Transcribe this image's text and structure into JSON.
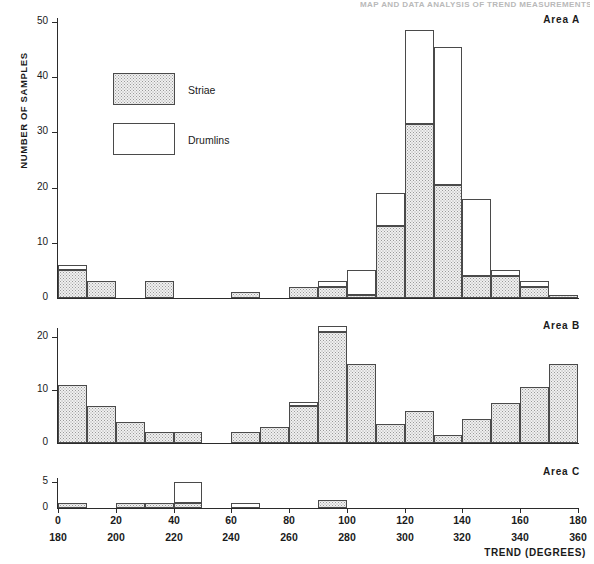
{
  "figure": {
    "cropped_header_text": "MAP AND DATA ANALYSIS OF TREND MEASUREMENTS",
    "y_axis_label": "NUMBER OF SAMPLES",
    "x_axis_label": "TREND (DEGREES)"
  },
  "legend": {
    "items": [
      {
        "label": "Striae",
        "pattern": "stippled"
      },
      {
        "label": "Drumlins",
        "pattern": "open"
      }
    ]
  },
  "panels": [
    {
      "tag": "Area A"
    },
    {
      "tag": "Area B"
    },
    {
      "tag": "Area C"
    }
  ],
  "chart_data": {
    "type": "bar",
    "subtype": "stacked-histogram",
    "title": "",
    "xlabel": "TREND (DEGREES)",
    "ylabel": "NUMBER OF SAMPLES",
    "bin_width": 10,
    "x": [
      0,
      10,
      20,
      30,
      40,
      50,
      60,
      70,
      80,
      90,
      100,
      110,
      120,
      130,
      140,
      150,
      160,
      170
    ],
    "bin_starts_primary": [
      0,
      10,
      20,
      30,
      40,
      50,
      60,
      70,
      80,
      90,
      100,
      110,
      120,
      130,
      140,
      150,
      160,
      170
    ],
    "bin_starts_secondary": [
      180,
      190,
      200,
      210,
      220,
      230,
      240,
      250,
      260,
      270,
      280,
      290,
      300,
      310,
      320,
      330,
      340,
      350
    ],
    "x_ticks_primary": [
      0,
      20,
      40,
      60,
      80,
      100,
      120,
      140,
      160,
      180
    ],
    "x_ticks_secondary": [
      180,
      200,
      220,
      240,
      260,
      280,
      300,
      320,
      340,
      360
    ],
    "xlim": [
      0,
      180
    ],
    "grid": false,
    "legend_position": "upper-left",
    "panels": [
      {
        "name": "Area A",
        "ylim": [
          0,
          52
        ],
        "y_ticks": [
          0,
          10,
          20,
          30,
          40,
          50
        ],
        "series": [
          {
            "name": "Striae",
            "values": [
              5,
              3,
              0,
              3,
              0,
              0,
              1,
              0,
              2,
              2,
              0.5,
              13,
              31.5,
              20.5,
              4,
              4,
              2,
              0.5,
              3.5
            ]
          },
          {
            "name": "Drumlins",
            "values": [
              1,
              0,
              0,
              0,
              0,
              0,
              0,
              0,
              0,
              1,
              4.5,
              6,
              17,
              25,
              14,
              1,
              1,
              0,
              0
            ]
          }
        ],
        "totals": [
          6,
          3,
          0,
          3,
          0,
          0,
          1,
          0,
          2,
          3,
          5,
          19,
          48.5,
          45.5,
          18,
          5,
          3,
          0.5,
          3.5
        ]
      },
      {
        "name": "Area B",
        "ylim": [
          0,
          23
        ],
        "y_ticks": [
          0,
          10,
          20
        ],
        "series": [
          {
            "name": "Striae",
            "values": [
              11,
              7,
              4,
              2,
              2,
              0,
              2,
              3,
              7,
              21,
              15,
              3.5,
              6,
              1.5,
              4.5,
              7.5,
              10.5,
              15
            ]
          },
          {
            "name": "Drumlins",
            "values": [
              0,
              0,
              0,
              0,
              0,
              0,
              0,
              0,
              0.8,
              1,
              0,
              0,
              0,
              0,
              0,
              0,
              0,
              0
            ]
          }
        ],
        "totals": [
          11,
          7,
          4,
          2,
          2,
          0,
          2,
          3,
          7.8,
          22,
          15,
          3.5,
          6,
          1.5,
          4.5,
          7.5,
          10.5,
          15
        ]
      },
      {
        "name": "Area C",
        "ylim": [
          0,
          6
        ],
        "y_ticks": [
          0,
          5
        ],
        "series": [
          {
            "name": "Striae",
            "values": [
              1,
              0,
              1,
              1,
              1,
              0,
              0,
              0,
              0,
              1.5,
              0,
              0,
              0,
              0,
              0,
              0,
              0,
              0
            ]
          },
          {
            "name": "Drumlins",
            "values": [
              0,
              0,
              0,
              0,
              4,
              0,
              1,
              0,
              0,
              0,
              0,
              0,
              0,
              0,
              0,
              0,
              0,
              0
            ]
          }
        ],
        "totals": [
          1,
          0,
          1,
          1,
          5,
          0,
          1,
          0,
          0,
          1.5,
          0,
          0,
          0,
          0,
          0,
          0,
          0,
          0
        ]
      }
    ]
  }
}
